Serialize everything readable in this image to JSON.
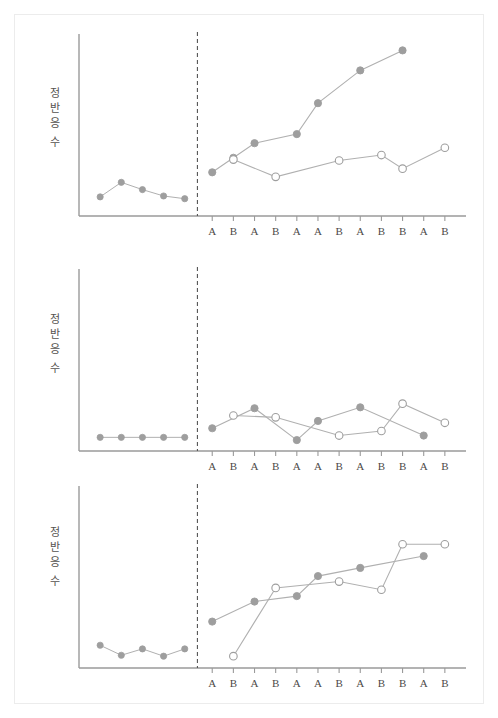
{
  "figure": {
    "title": "",
    "background": "#ffffff",
    "border_color": "#ececec",
    "axis_color": "#9a9a9a",
    "phase_line_color": "#555555",
    "marker_filled_color": "#9e9e9e",
    "marker_open_color": "#ffffff",
    "marker_edge_color": "#9e9e9e",
    "line_color": "#b0b0b0"
  },
  "y_axis_label": {
    "full": "정반응 수",
    "chars": [
      "정",
      "반",
      "응",
      "수"
    ]
  },
  "x_tick_labels": [
    "A",
    "B",
    "A",
    "B",
    "A",
    "A",
    "B",
    "A",
    "B",
    "B",
    "A",
    "B"
  ],
  "chart_data": [
    {
      "type": "line",
      "panel_index": 1,
      "title": "",
      "xlabel": "",
      "ylabel": "정반응 수",
      "xlim": [
        0,
        17
      ],
      "ylim": [
        0,
        10
      ],
      "grid": false,
      "legend": "none",
      "phase_divider_x": 5.6,
      "baseline": {
        "name": "baseline",
        "marker": "filled-circle",
        "x": [
          1.0,
          2.0,
          3.0,
          4.0,
          5.0
        ],
        "values": [
          1.05,
          1.85,
          1.45,
          1.1,
          0.95
        ]
      },
      "series": [
        {
          "name": "filled-series",
          "marker": "filled-circle",
          "x": [
            6.3,
            7.3,
            8.3,
            9.3,
            10.3,
            11.3,
            12.3,
            13.3,
            14.3,
            15.3,
            16.3,
            17.3
          ],
          "values": [
            2.4,
            3.2,
            4.0,
            4.0,
            4.5,
            4.5,
            6.2,
            6.2,
            8.0,
            8.0,
            9.1,
            9.1
          ],
          "point_count": 7,
          "x_used": [
            6.3,
            7.3,
            8.3,
            10.3,
            11.3,
            13.3,
            15.3
          ],
          "values_used": [
            2.4,
            3.2,
            4.0,
            4.5,
            6.2,
            8.0,
            9.1
          ]
        },
        {
          "name": "open-series",
          "marker": "open-circle",
          "x": [
            7.3,
            9.3,
            12.3,
            14.3,
            15.3,
            17.3
          ],
          "values": [
            3.1,
            2.15,
            3.05,
            3.35,
            2.6,
            3.75
          ]
        }
      ]
    },
    {
      "type": "line",
      "panel_index": 2,
      "title": "",
      "xlabel": "",
      "ylabel": "정반응 수",
      "xlim": [
        0,
        17
      ],
      "ylim": [
        0,
        10
      ],
      "grid": false,
      "legend": "none",
      "phase_divider_x": 5.6,
      "baseline": {
        "name": "baseline",
        "marker": "filled-circle",
        "x": [
          1.0,
          2.0,
          3.0,
          4.0,
          5.0
        ],
        "values": [
          0.75,
          0.75,
          0.75,
          0.75,
          0.75
        ]
      },
      "series": [
        {
          "name": "filled-series",
          "marker": "filled-circle",
          "x": [
            6.3,
            8.3,
            10.3,
            11.3,
            13.3,
            16.3
          ],
          "values": [
            1.25,
            2.35,
            0.6,
            1.65,
            2.4,
            0.85
          ]
        },
        {
          "name": "open-series",
          "marker": "open-circle",
          "x": [
            7.3,
            9.3,
            12.3,
            14.3,
            15.3,
            17.3
          ],
          "values": [
            1.95,
            1.85,
            0.85,
            1.1,
            2.6,
            1.55
          ]
        }
      ]
    },
    {
      "type": "line",
      "panel_index": 3,
      "title": "",
      "xlabel": "",
      "ylabel": "정반응 수",
      "xlim": [
        0,
        17
      ],
      "ylim": [
        0,
        10
      ],
      "grid": false,
      "legend": "none",
      "phase_divider_x": 5.6,
      "baseline": {
        "name": "baseline",
        "marker": "filled-circle",
        "x": [
          1.0,
          2.0,
          3.0,
          4.0,
          5.0
        ],
        "values": [
          1.25,
          0.7,
          1.05,
          0.65,
          1.05
        ]
      },
      "series": [
        {
          "name": "filled-series",
          "marker": "filled-circle",
          "x": [
            6.3,
            8.3,
            10.3,
            11.3,
            13.3,
            16.3
          ],
          "values": [
            2.55,
            3.65,
            3.95,
            5.05,
            5.5,
            6.15
          ]
        },
        {
          "name": "open-series",
          "marker": "open-circle",
          "x": [
            7.3,
            9.3,
            12.3,
            14.3,
            15.3,
            17.3
          ],
          "values": [
            0.65,
            4.4,
            4.75,
            4.3,
            6.8,
            6.8
          ]
        }
      ]
    }
  ]
}
